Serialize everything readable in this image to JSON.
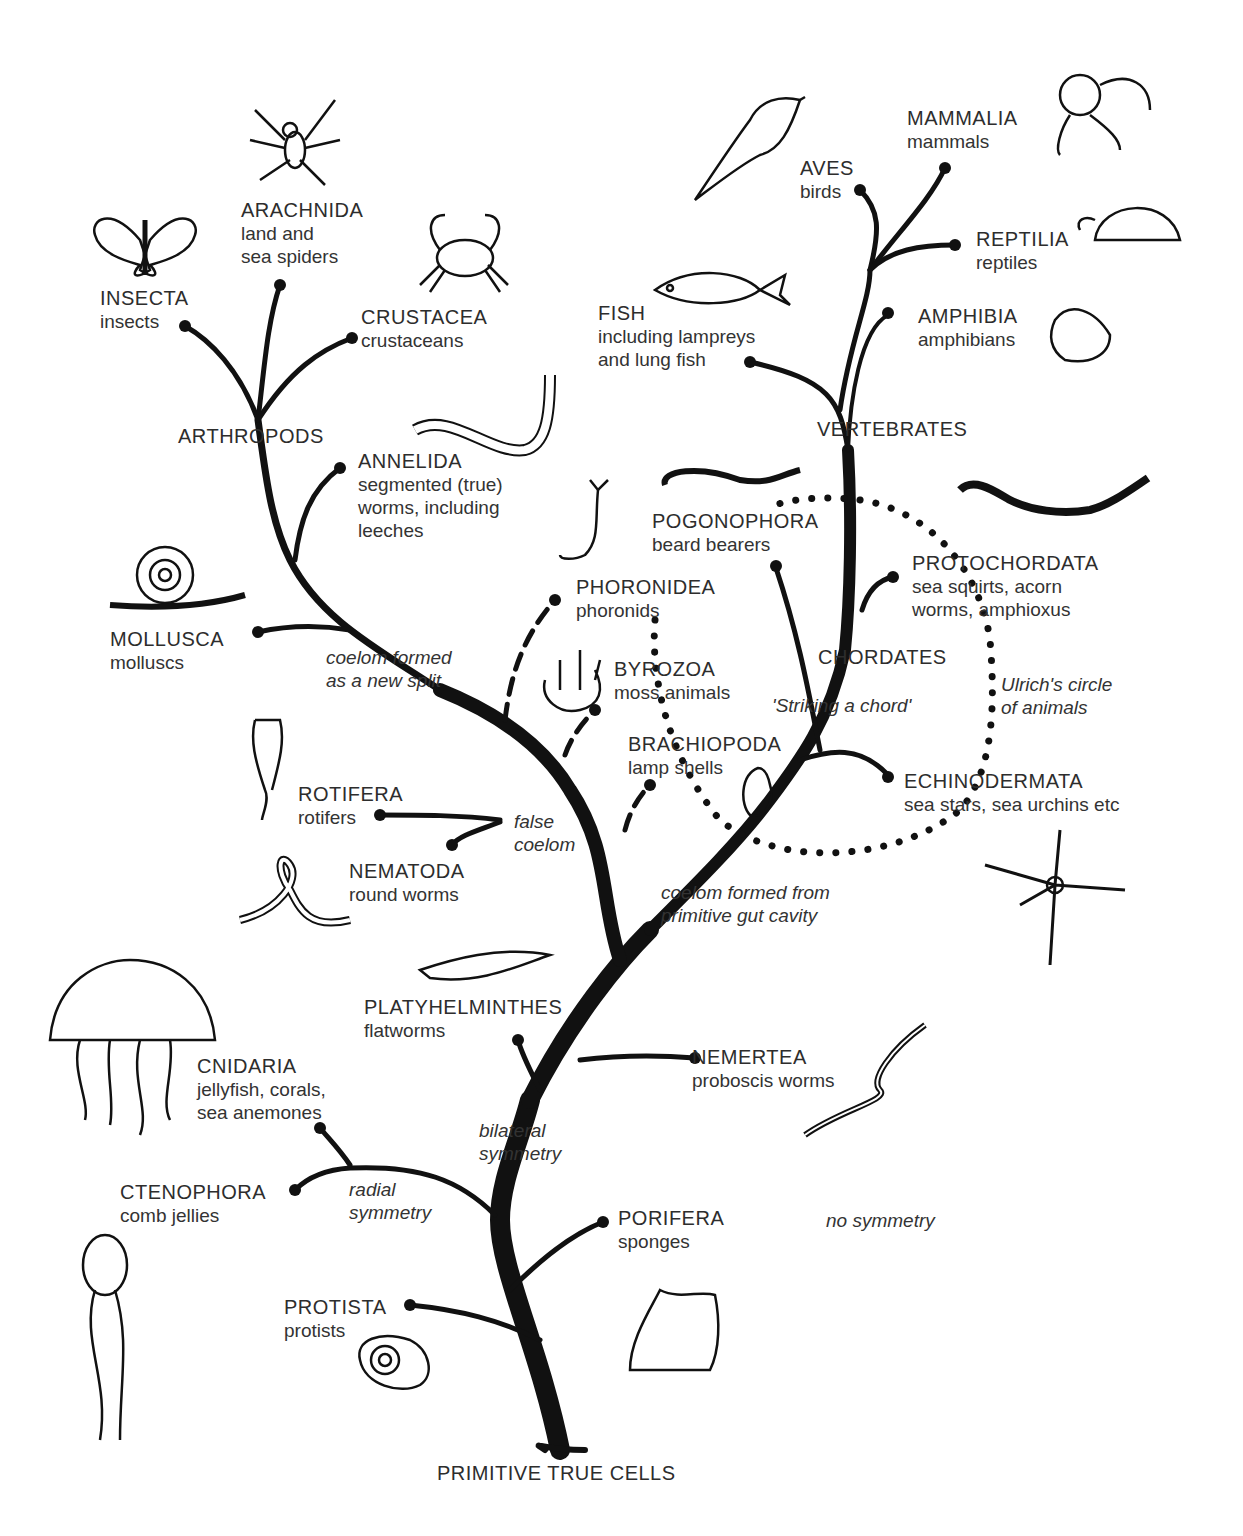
{
  "diagram": {
    "root": "PRIMITIVE TRUE CELLS",
    "groups": {
      "arthropods": "ARTHROPODS",
      "vertebrates": "VERTEBRATES",
      "chordates": "CHORDATES"
    },
    "taxa": {
      "insecta": {
        "name": "INSECTA",
        "common": [
          "insects"
        ]
      },
      "arachnida": {
        "name": "ARACHNIDA",
        "common": [
          "land and",
          "sea spiders"
        ]
      },
      "crustacea": {
        "name": "CRUSTACEA",
        "common": [
          "crustaceans"
        ]
      },
      "annelida": {
        "name": "ANNELIDA",
        "common": [
          "segmented (true)",
          "worms, including",
          "leeches"
        ]
      },
      "mollusca": {
        "name": "MOLLUSCA",
        "common": [
          "molluscs"
        ]
      },
      "aves": {
        "name": "AVES",
        "common": [
          "birds"
        ]
      },
      "mammalia": {
        "name": "MAMMALIA",
        "common": [
          "mammals"
        ]
      },
      "reptilia": {
        "name": "REPTILIA",
        "common": [
          "reptiles"
        ]
      },
      "amphibia": {
        "name": "AMPHIBIA",
        "common": [
          "amphibians"
        ]
      },
      "fish": {
        "name": "FISH",
        "common": [
          "including lampreys",
          "and lung fish"
        ]
      },
      "pogonophora": {
        "name": "POGONOPHORA",
        "common": [
          "beard bearers"
        ]
      },
      "protochordata": {
        "name": "PROTOCHORDATA",
        "common": [
          "sea squirts, acorn",
          "worms, amphioxus"
        ]
      },
      "phoronidea": {
        "name": "PHORONIDEA",
        "common": [
          "phoronids"
        ]
      },
      "byrozoa": {
        "name": "BYROZOA",
        "common": [
          "moss animals"
        ]
      },
      "brachiopoda": {
        "name": "BRACHIOPODA",
        "common": [
          "lamp shells"
        ]
      },
      "echinodermata": {
        "name": "ECHINODERMATA",
        "common": [
          "sea stars, sea urchins etc"
        ]
      },
      "rotifera": {
        "name": "ROTIFERA",
        "common": [
          "rotifers"
        ]
      },
      "nematoda": {
        "name": "NEMATODA",
        "common": [
          "round worms"
        ]
      },
      "platyhelminthes": {
        "name": "PLATYHELMINTHES",
        "common": [
          "flatworms"
        ]
      },
      "nemertea": {
        "name": "NEMERTEA",
        "common": [
          "proboscis worms"
        ]
      },
      "cnidaria": {
        "name": "CNIDARIA",
        "common": [
          "jellyfish, corals,",
          "sea anemones"
        ]
      },
      "ctenophora": {
        "name": "CTENOPHORA",
        "common": [
          "comb jellies"
        ]
      },
      "porifera": {
        "name": "PORIFERA",
        "common": [
          "sponges"
        ]
      },
      "protista": {
        "name": "PROTISTA",
        "common": [
          "protists"
        ]
      }
    },
    "notes": {
      "coelom_new_split": [
        "coelom formed",
        "as a new split"
      ],
      "striking_chord": [
        "'Striking a chord'"
      ],
      "ulrich": [
        "Ulrich's circle",
        "of animals"
      ],
      "false_coelom": [
        "false",
        "coelom"
      ],
      "coelom_gut": [
        "coelom formed from",
        "primitive gut cavity"
      ],
      "bilateral": [
        "bilateral",
        "symmetry"
      ],
      "radial": [
        "radial",
        "symmetry"
      ],
      "no_symmetry": [
        "no symmetry"
      ]
    },
    "illustrations": [
      "butterfly-icon",
      "spider-icon",
      "crab-icon",
      "earthworm-icon",
      "snail-icon",
      "bird-icon",
      "monkey-icon",
      "tortoise-icon",
      "fish-icon",
      "frog-icon",
      "beard-worm-icon",
      "acorn-worm-icon",
      "phoronid-icon",
      "bryozoan-icon",
      "lamp-shell-icon",
      "brittle-star-icon",
      "rotifer-icon",
      "roundworm-icon",
      "flatworm-icon",
      "ribbon-worm-icon",
      "jellyfish-icon",
      "comb-jelly-icon",
      "sponge-icon",
      "amoeba-icon"
    ],
    "colors": {
      "ink": "#111111",
      "paper": "#ffffff",
      "text": "#2d2d2d"
    }
  }
}
